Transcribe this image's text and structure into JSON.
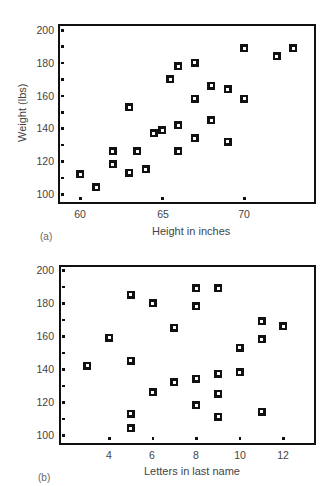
{
  "chart_data": [
    {
      "id": "a",
      "type": "scatter",
      "panel_label": "(a)",
      "title": "",
      "xlabel": "Height in inches",
      "ylabel": "Weight (lbs)",
      "xlim": [
        59,
        74
      ],
      "ylim": [
        96,
        204
      ],
      "xticks": [
        60,
        65,
        70
      ],
      "yticks": [
        100,
        120,
        140,
        160,
        180,
        200
      ],
      "grid": false,
      "marker": "hollow-square",
      "points": [
        {
          "x": 60,
          "y": 112
        },
        {
          "x": 61,
          "y": 104
        },
        {
          "x": 62,
          "y": 126
        },
        {
          "x": 62,
          "y": 118
        },
        {
          "x": 63,
          "y": 153
        },
        {
          "x": 63,
          "y": 113
        },
        {
          "x": 63.5,
          "y": 126
        },
        {
          "x": 64,
          "y": 115
        },
        {
          "x": 64.5,
          "y": 137
        },
        {
          "x": 65,
          "y": 139
        },
        {
          "x": 65.5,
          "y": 170
        },
        {
          "x": 66,
          "y": 178
        },
        {
          "x": 66,
          "y": 142
        },
        {
          "x": 66,
          "y": 126
        },
        {
          "x": 67,
          "y": 180
        },
        {
          "x": 67,
          "y": 158
        },
        {
          "x": 67,
          "y": 134
        },
        {
          "x": 68,
          "y": 166
        },
        {
          "x": 68,
          "y": 145
        },
        {
          "x": 69,
          "y": 164
        },
        {
          "x": 69,
          "y": 132
        },
        {
          "x": 70,
          "y": 189
        },
        {
          "x": 70,
          "y": 158
        },
        {
          "x": 72,
          "y": 184
        },
        {
          "x": 73,
          "y": 189
        }
      ]
    },
    {
      "id": "b",
      "type": "scatter",
      "panel_label": "(b)",
      "title": "",
      "xlabel": "Letters in last name",
      "ylabel": "",
      "xlim": [
        1.7,
        13.5
      ],
      "ylim": [
        96,
        204
      ],
      "xticks": [
        4,
        6,
        8,
        10,
        12
      ],
      "yticks": [
        100,
        120,
        140,
        160,
        180,
        200
      ],
      "grid": false,
      "marker": "hollow-square",
      "points": [
        {
          "x": 3,
          "y": 142
        },
        {
          "x": 4,
          "y": 159
        },
        {
          "x": 5,
          "y": 185
        },
        {
          "x": 5,
          "y": 145
        },
        {
          "x": 5,
          "y": 113
        },
        {
          "x": 5,
          "y": 104
        },
        {
          "x": 6,
          "y": 180
        },
        {
          "x": 6,
          "y": 126
        },
        {
          "x": 7,
          "y": 165
        },
        {
          "x": 7,
          "y": 132
        },
        {
          "x": 8,
          "y": 189
        },
        {
          "x": 8,
          "y": 178
        },
        {
          "x": 8,
          "y": 134
        },
        {
          "x": 8,
          "y": 118
        },
        {
          "x": 9,
          "y": 189
        },
        {
          "x": 9,
          "y": 137
        },
        {
          "x": 9,
          "y": 125
        },
        {
          "x": 9,
          "y": 111
        },
        {
          "x": 10,
          "y": 153
        },
        {
          "x": 10,
          "y": 138
        },
        {
          "x": 11,
          "y": 169
        },
        {
          "x": 11,
          "y": 158
        },
        {
          "x": 11,
          "y": 114
        },
        {
          "x": 12,
          "y": 166
        }
      ]
    }
  ],
  "panels": {
    "a": {
      "tag": "(a)",
      "xlabel": "Height in inches",
      "ylabel": "Weight (lbs)",
      "yticks": [
        "200",
        "180",
        "160",
        "140",
        "120",
        "100"
      ],
      "xticks": [
        "60",
        "65",
        "70"
      ]
    },
    "b": {
      "tag": "(b)",
      "xlabel": "Letters in last name",
      "yticks": [
        "200",
        "180",
        "160",
        "140",
        "120",
        "100"
      ],
      "xticks": [
        "4",
        "6",
        "8",
        "10",
        "12"
      ]
    }
  }
}
